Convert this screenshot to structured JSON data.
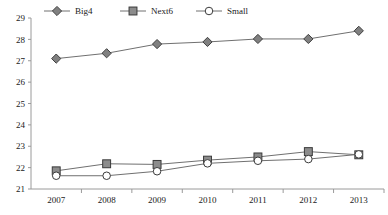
{
  "chart_data": {
    "type": "line",
    "title": "",
    "subtitle": "",
    "xlabel": "",
    "ylabel": "",
    "categories": [
      "2007",
      "2008",
      "2009",
      "2010",
      "2011",
      "2012",
      "2013"
    ],
    "x": [
      2007,
      2008,
      2009,
      2010,
      2011,
      2012,
      2013
    ],
    "ylim": [
      21,
      29
    ],
    "yticks": [
      21,
      22,
      23,
      24,
      25,
      26,
      27,
      28,
      29
    ],
    "ytick_labels": [
      "21",
      "22",
      "23",
      "24",
      "25",
      "26",
      "27",
      "28",
      "29"
    ],
    "grid": false,
    "legend_position": "top-left",
    "series": [
      {
        "name": "Big4",
        "marker": "diamond",
        "marker_fill": "#808080",
        "marker_edge": "#404040",
        "line_color": "#707070",
        "values": [
          27.1,
          27.35,
          27.78,
          27.88,
          28.02,
          28.02,
          28.4
        ]
      },
      {
        "name": "Next6",
        "marker": "square",
        "marker_fill": "#8c8c8c",
        "marker_edge": "#3a3a3a",
        "line_color": "#707070",
        "values": [
          21.85,
          22.18,
          22.15,
          22.35,
          22.5,
          22.75,
          22.6
        ]
      },
      {
        "name": "Small",
        "marker": "circle",
        "marker_fill": "#ffffff",
        "marker_edge": "#3a3a3a",
        "line_color": "#707070",
        "values": [
          21.62,
          21.62,
          21.83,
          22.2,
          22.32,
          22.4,
          22.62
        ]
      }
    ],
    "axis_color": "#9a9a9a",
    "text_color": "#1a1a1a"
  },
  "legend": {
    "items": [
      {
        "label": "Big4"
      },
      {
        "label": "Next6"
      },
      {
        "label": "Small"
      }
    ]
  }
}
